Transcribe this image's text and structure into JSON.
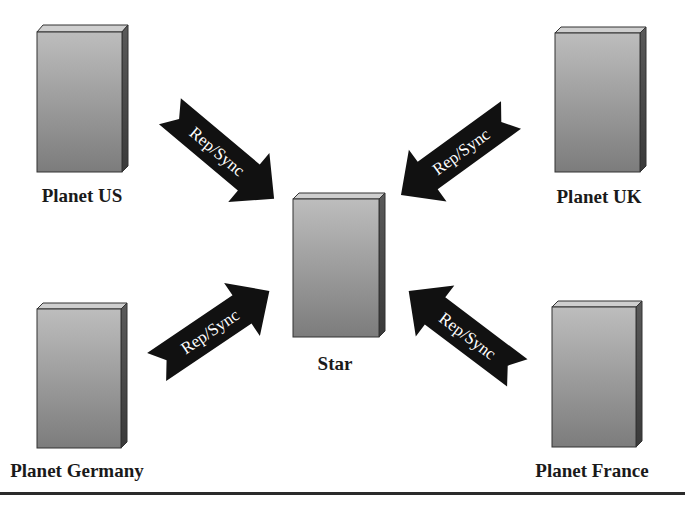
{
  "diagram": {
    "hub": {
      "label": "Star"
    },
    "nodes": [
      {
        "id": "us",
        "label": "Planet US"
      },
      {
        "id": "uk",
        "label": "Planet UK"
      },
      {
        "id": "germany",
        "label": "Planet Germany"
      },
      {
        "id": "france",
        "label": "Planet France"
      }
    ],
    "edges": [
      {
        "from": "us",
        "to": "star",
        "label": "Rep/Sync"
      },
      {
        "from": "uk",
        "to": "star",
        "label": "Rep/Sync"
      },
      {
        "from": "germany",
        "to": "star",
        "label": "Rep/Sync"
      },
      {
        "from": "france",
        "to": "star",
        "label": "Rep/Sync"
      }
    ],
    "colors": {
      "box_face_light": "#b8b8b8",
      "box_face_dark": "#7a7a7a",
      "box_side": "#4a4a4a",
      "box_top": "#d0d0d0",
      "arrow": "#111111",
      "arrow_text": "#ffffff",
      "rule": "#333333"
    }
  }
}
